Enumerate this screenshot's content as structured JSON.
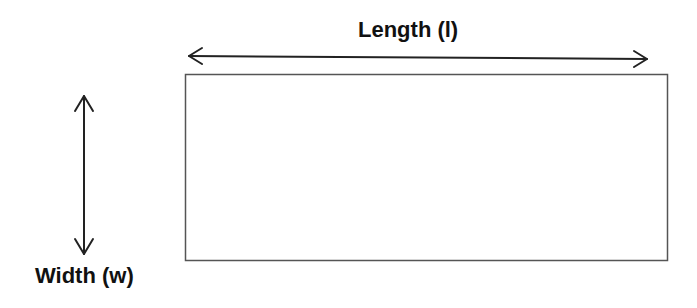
{
  "diagram": {
    "type": "rectangle-dimensions",
    "labels": {
      "length": "Length (l)",
      "width": "Width (w)"
    },
    "colors": {
      "stroke": "#222222",
      "rect_stroke": "#555555",
      "background": "#ffffff",
      "text": "#111111"
    }
  }
}
